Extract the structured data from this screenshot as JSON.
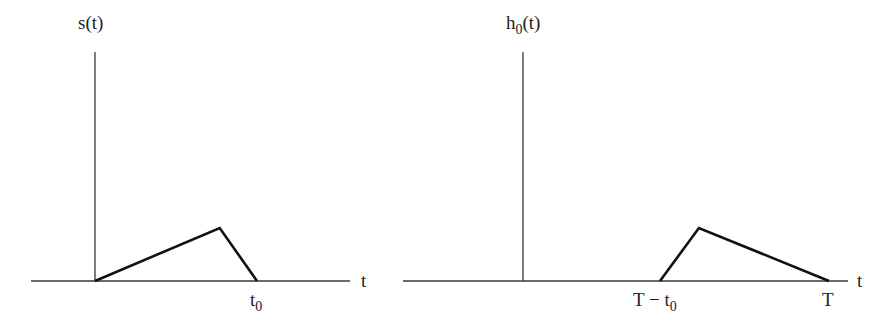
{
  "panels": [
    {
      "id": "left",
      "y_label": {
        "main": "s",
        "sub": "",
        "arg": "(t)"
      },
      "x_label": "t",
      "waveform": {
        "description": "triangular pulse: linear rise from 0 to peak, then steep linear fall to zero at t0",
        "points": [
          {
            "t": 0,
            "v": 0
          },
          {
            "t": 0.77,
            "v": 1
          },
          {
            "t": 1.0,
            "v": 0
          }
        ],
        "t_unit": "t0"
      },
      "tick_labels": [
        {
          "text": "t",
          "sub": "0",
          "t": 1.0
        }
      ]
    },
    {
      "id": "right",
      "y_label": {
        "main": "h",
        "sub": "0",
        "arg": "(t)"
      },
      "x_label": "t",
      "waveform": {
        "description": "time-reversed and delayed copy of s(t): steep rise starting at T - t0, then slow linear fall to zero at T",
        "points": [
          {
            "t": 0,
            "v": 0
          },
          {
            "t": 0.23,
            "v": 1
          },
          {
            "t": 1.0,
            "v": 0
          }
        ],
        "t_unit": "offset from T - t0, scaled by t0"
      },
      "tick_labels": [
        {
          "text": "T − t",
          "sub": "0",
          "t": 0
        },
        {
          "text": "T",
          "sub": "",
          "t": 1.0
        }
      ]
    }
  ]
}
